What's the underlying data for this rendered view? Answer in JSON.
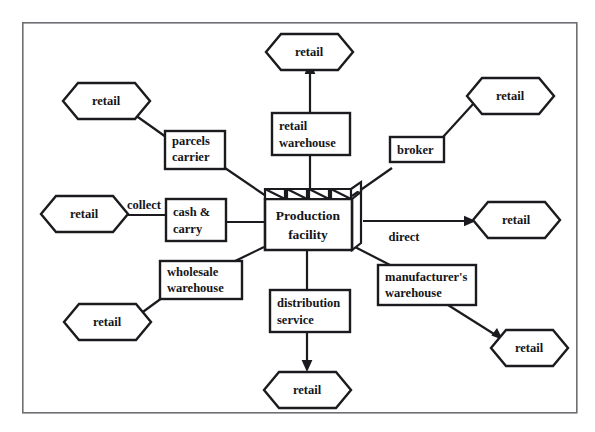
{
  "diagram": {
    "type": "node-link-diagram",
    "canvas": {
      "width": 595,
      "height": 432
    },
    "frame": {
      "x": 22,
      "y": 22,
      "width": 555,
      "height": 391,
      "stroke": "#6f6f73"
    },
    "colors": {
      "node_stroke": "#1b1b1f",
      "node_fill": "#ffffff",
      "text": "#151518",
      "frame": "#6f6f73"
    },
    "center": {
      "id": "production-facility",
      "shape": "factory",
      "label_line1": "Production",
      "label_line2": "facility"
    },
    "intermediaries": [
      {
        "id": "parcels-carrier",
        "shape": "box",
        "line1": "parcels",
        "line2": "carrier"
      },
      {
        "id": "retail-warehouse",
        "shape": "box",
        "line1": "retail",
        "line2": "warehouse"
      },
      {
        "id": "broker",
        "shape": "box",
        "line1": "broker",
        "line2": ""
      },
      {
        "id": "cash-and-carry",
        "shape": "box",
        "line1": "cash &",
        "line2": "carry"
      },
      {
        "id": "wholesale-warehouse",
        "shape": "box",
        "line1": "wholesale",
        "line2": "warehouse"
      },
      {
        "id": "distribution-service",
        "shape": "box",
        "line1": "distribution",
        "line2": "service"
      },
      {
        "id": "manufacturers-warehouse",
        "shape": "box",
        "line1": "manufacturer's",
        "line2": "warehouse"
      }
    ],
    "endpoints": [
      {
        "id": "retail-top",
        "shape": "hexagon",
        "label": "retail"
      },
      {
        "id": "retail-top-left",
        "shape": "hexagon",
        "label": "retail"
      },
      {
        "id": "retail-top-right",
        "shape": "hexagon",
        "label": "retail"
      },
      {
        "id": "retail-left",
        "shape": "hexagon",
        "label": "retail"
      },
      {
        "id": "retail-right",
        "shape": "hexagon",
        "label": "retail"
      },
      {
        "id": "retail-bottom-left",
        "shape": "hexagon",
        "label": "retail"
      },
      {
        "id": "retail-bottom",
        "shape": "hexagon",
        "label": "retail"
      },
      {
        "id": "retail-bottom-right",
        "shape": "hexagon",
        "label": "retail"
      }
    ],
    "edge_labels": [
      {
        "id": "collect",
        "text": "collect"
      },
      {
        "id": "direct",
        "text": "direct"
      }
    ]
  }
}
